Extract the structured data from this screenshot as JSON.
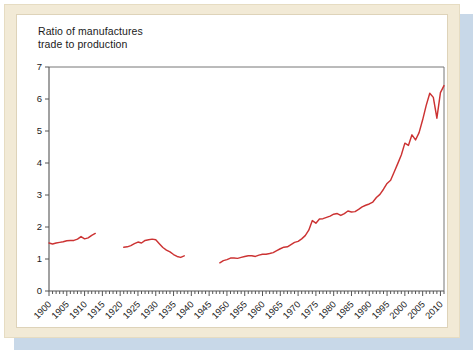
{
  "figure": {
    "title_line1": "Ratio of manufactures",
    "title_line2": "trade to production",
    "title": "Ratio of manufactures\ntrade to production",
    "line_color": "#cc3333",
    "axis_color": "#555555",
    "frame_color": "#f2ead6",
    "card_color": "#ffffff",
    "shadow_color": "#c8d8e8"
  },
  "chart_data": {
    "type": "line",
    "title": "Ratio of manufactures trade to production",
    "xlabel": "",
    "ylabel": "",
    "xlim": [
      1900,
      2011
    ],
    "ylim": [
      0,
      7
    ],
    "grid": false,
    "legend": "none",
    "y_ticks": [
      0,
      1,
      2,
      3,
      4,
      5,
      6,
      7
    ],
    "y_tick_labels": [
      "0",
      "1",
      "2",
      "3",
      "4",
      "5",
      "6",
      "7"
    ],
    "x_ticks": [
      1900,
      1905,
      1910,
      1915,
      1920,
      1925,
      1930,
      1935,
      1940,
      1945,
      1950,
      1955,
      1960,
      1965,
      1970,
      1975,
      1980,
      1985,
      1990,
      1995,
      2000,
      2005,
      2010
    ],
    "x_tick_labels": [
      "1900",
      "1905",
      "1910",
      "1915",
      "1920",
      "1925",
      "1930",
      "1935",
      "1940",
      "1945",
      "1950",
      "1955",
      "1960",
      "1965",
      "1970",
      "1975",
      "1980",
      "1985",
      "1990",
      "1995",
      "2000",
      "2005",
      "2010"
    ],
    "x_minor_tick_step": 1,
    "series": [
      {
        "name": "Ratio of manufactures trade to production",
        "color": "#cc3333",
        "segments": [
          {
            "label": "pre-World-War-I",
            "x": [
              1900,
              1901,
              1902,
              1903,
              1904,
              1905,
              1906,
              1907,
              1908,
              1909,
              1910,
              1911,
              1912,
              1913
            ],
            "y": [
              1.5,
              1.47,
              1.5,
              1.52,
              1.54,
              1.57,
              1.58,
              1.58,
              1.62,
              1.7,
              1.63,
              1.66,
              1.74,
              1.8
            ]
          },
          {
            "label": "interwar",
            "x": [
              1921,
              1922,
              1923,
              1924,
              1925,
              1926,
              1927,
              1928,
              1929,
              1930,
              1931,
              1932,
              1933,
              1934,
              1935,
              1936,
              1937,
              1938
            ],
            "y": [
              1.37,
              1.38,
              1.42,
              1.48,
              1.53,
              1.5,
              1.58,
              1.6,
              1.62,
              1.6,
              1.48,
              1.36,
              1.28,
              1.22,
              1.14,
              1.08,
              1.05,
              1.1
            ]
          },
          {
            "label": "post-World-War-II",
            "x": [
              1948,
              1949,
              1950,
              1951,
              1952,
              1953,
              1954,
              1955,
              1956,
              1957,
              1958,
              1959,
              1960,
              1961,
              1962,
              1963,
              1964,
              1965,
              1966,
              1967,
              1968,
              1969,
              1970,
              1971,
              1972,
              1973,
              1974,
              1975,
              1976,
              1977,
              1978,
              1979,
              1980,
              1981,
              1982,
              1983,
              1984,
              1985,
              1986,
              1987,
              1988,
              1989,
              1990,
              1991,
              1992,
              1993,
              1994,
              1995,
              1996,
              1997,
              1998,
              1999,
              2000,
              2001,
              2002,
              2003,
              2004,
              2005,
              2006,
              2007,
              2008,
              2009,
              2010,
              2011
            ],
            "y": [
              0.88,
              0.95,
              0.98,
              1.03,
              1.03,
              1.02,
              1.05,
              1.08,
              1.1,
              1.1,
              1.08,
              1.12,
              1.15,
              1.15,
              1.17,
              1.2,
              1.26,
              1.32,
              1.37,
              1.38,
              1.45,
              1.52,
              1.55,
              1.63,
              1.73,
              1.9,
              2.2,
              2.12,
              2.25,
              2.26,
              2.3,
              2.34,
              2.4,
              2.42,
              2.36,
              2.42,
              2.5,
              2.47,
              2.48,
              2.55,
              2.63,
              2.68,
              2.72,
              2.78,
              2.92,
              3.02,
              3.18,
              3.36,
              3.46,
              3.72,
              3.98,
              4.25,
              4.62,
              4.55,
              4.88,
              4.72,
              4.95,
              5.35,
              5.8,
              6.18,
              6.05,
              5.4,
              6.2,
              6.42
            ]
          }
        ]
      }
    ]
  }
}
